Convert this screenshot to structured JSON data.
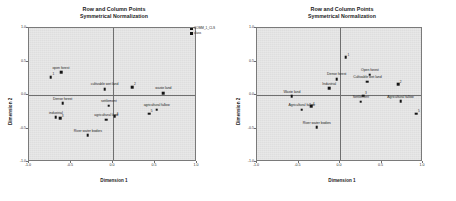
{
  "figure": {
    "width": 456,
    "height": 201,
    "background": "#ffffff",
    "panel_background": "#e3e3e3",
    "point_color": "#151515",
    "axis_color": "#6f6f6f"
  },
  "chart_data": [
    {
      "panel": "left",
      "type": "scatter",
      "title": "Row and Column Points",
      "subtitle": "Symmetrical Normalization",
      "xlabel": "Dimension 1",
      "ylabel": "Dimension 2",
      "xlim": [
        -1.0,
        1.0
      ],
      "ylim": [
        -1.0,
        1.0
      ],
      "xticks": [
        "-1.0",
        "-0.5",
        "0.0",
        "0.5",
        "1.0"
      ],
      "xtick_values": [
        -1.0,
        -0.5,
        0.0,
        0.5,
        1.0
      ],
      "yticks": [
        "1.0",
        "0.5",
        "0.0",
        "-0.5",
        "-1.0"
      ],
      "ytick_values": [
        1.0,
        0.5,
        0.0,
        -0.5,
        -1.0
      ],
      "grid": false,
      "legend_position": "right-outside",
      "legend": [
        {
          "name": "COMM_1_CLS",
          "marker": "square",
          "color": "#151515"
        },
        {
          "name": "class",
          "marker": "square",
          "color": "#151515"
        }
      ],
      "series": [
        {
          "name": "class",
          "marker": "square",
          "color": "#151515",
          "points": [
            {
              "label": "open forest",
              "x": -0.62,
              "y": 0.34
            },
            {
              "label": "",
              "x": -0.74,
              "y": 0.27,
              "annotation": "1"
            },
            {
              "label": "cultivable wet land",
              "x": -0.1,
              "y": 0.09
            },
            {
              "label": "waste land",
              "x": 0.6,
              "y": 0.03
            },
            {
              "label": "",
              "x": 0.23,
              "y": 0.12,
              "annotation": "2"
            },
            {
              "label": "Dense forest",
              "x": -0.6,
              "y": -0.12
            },
            {
              "label": "settlement",
              "x": -0.05,
              "y": -0.16
            },
            {
              "label": "industrial",
              "x": -0.68,
              "y": -0.33
            },
            {
              "label": "",
              "x": -0.63,
              "y": -0.35,
              "annotation": "3"
            },
            {
              "label": "agricultural land",
              "x": -0.08,
              "y": -0.37
            },
            {
              "label": "",
              "x": 0.02,
              "y": -0.32,
              "annotation": "4"
            },
            {
              "label": "agricultural fallow",
              "x": 0.52,
              "y": -0.22
            },
            {
              "label": "",
              "x": 0.43,
              "y": -0.28,
              "annotation": "5"
            },
            {
              "label": "River water bodies",
              "x": -0.3,
              "y": -0.6
            }
          ]
        }
      ]
    },
    {
      "panel": "right",
      "type": "scatter",
      "title": "Row and Column Points",
      "subtitle": "Symmetrical Normalization",
      "xlabel": "Dimension 1",
      "ylabel": "Dimension 2",
      "xlim": [
        -1.0,
        1.0
      ],
      "ylim": [
        -1.0,
        1.0
      ],
      "xticks": [
        "-1.0",
        "-0.5",
        "0.0",
        "0.5",
        "1.0"
      ],
      "xtick_values": [
        -1.0,
        -0.5,
        0.0,
        0.5,
        1.0
      ],
      "yticks": [
        "1.0",
        "0.5",
        "0.0",
        "-0.5",
        "-1.0"
      ],
      "ytick_values": [
        1.0,
        0.5,
        0.0,
        -0.5,
        -1.0
      ],
      "grid": false,
      "legend_position": "right-outside",
      "legend": [
        {
          "name": "COMM_1_CLS",
          "marker": "square",
          "color": "#151515"
        },
        {
          "name": "class",
          "marker": "square",
          "color": "#151515"
        }
      ],
      "series": [
        {
          "name": "class",
          "marker": "square",
          "color": "#151515",
          "points": [
            {
              "label": "",
              "x": 0.07,
              "y": 0.56,
              "annotation": "1"
            },
            {
              "label": "Open forest",
              "x": 0.36,
              "y": 0.3
            },
            {
              "label": "Dense forest",
              "x": -0.04,
              "y": 0.24
            },
            {
              "label": "Cultivable wet land",
              "x": 0.33,
              "y": 0.2
            },
            {
              "label": "",
              "x": 0.7,
              "y": 0.16,
              "annotation": "2"
            },
            {
              "label": "Industrial",
              "x": -0.13,
              "y": 0.1
            },
            {
              "label": "Waste land",
              "x": -0.58,
              "y": -0.02
            },
            {
              "label": "",
              "x": 0.28,
              "y": -0.01,
              "annotation": "3"
            },
            {
              "label": "Settlement",
              "x": 0.25,
              "y": -0.1
            },
            {
              "label": "Agricultural fallow",
              "x": 0.73,
              "y": -0.09
            },
            {
              "label": "Agricultural fallow",
              "x": -0.46,
              "y": -0.22
            },
            {
              "label": "",
              "x": -0.35,
              "y": -0.17,
              "annotation": "4"
            },
            {
              "label": "",
              "x": 0.92,
              "y": -0.28,
              "annotation": "5"
            },
            {
              "label": "River water bodies",
              "x": -0.28,
              "y": -0.48
            }
          ]
        }
      ]
    }
  ]
}
